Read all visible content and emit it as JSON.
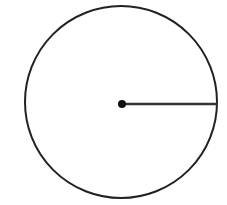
{
  "diagram": {
    "type": "circle-with-radius",
    "width": 227,
    "height": 205,
    "circle": {
      "cx": 121,
      "cy": 102,
      "r": 96,
      "stroke": "#222222",
      "stroke_width": 2
    },
    "center_point": {
      "cx": 122,
      "cy": 104,
      "r": 4,
      "fill": "#111111"
    },
    "radius_line": {
      "x1": 122,
      "y1": 104,
      "x2": 217,
      "y2": 104,
      "stroke": "#333333",
      "stroke_width": 2.5
    },
    "background": "#ffffff"
  }
}
